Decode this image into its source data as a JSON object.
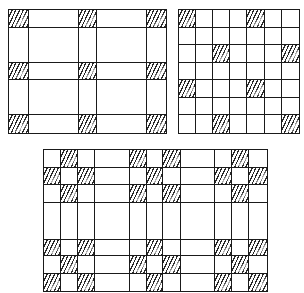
{
  "diagram": {
    "type": "grid-patterns",
    "hatch_color": "#2a2a2a",
    "line_color": "#1a1a1a",
    "grids": [
      {
        "name": "grid-top-left",
        "x": 8,
        "y": 9,
        "width": 159,
        "height": 125,
        "col_widths": [
          20,
          51,
          18,
          51,
          19
        ],
        "row_heights": [
          18,
          36,
          17,
          36,
          18
        ],
        "hatched": [
          [
            0,
            0
          ],
          [
            0,
            2
          ],
          [
            0,
            4
          ],
          [
            2,
            0
          ],
          [
            2,
            2
          ],
          [
            2,
            4
          ],
          [
            4,
            0
          ],
          [
            4,
            2
          ],
          [
            4,
            4
          ]
        ]
      },
      {
        "name": "grid-top-right",
        "x": 178,
        "y": 9,
        "width": 122,
        "height": 125,
        "col_widths": [
          17.4,
          17.4,
          17.4,
          17.4,
          17.4,
          17.4,
          17.6
        ],
        "row_heights": [
          17.8,
          17.8,
          17.8,
          17.8,
          17.8,
          17.8,
          18.2
        ],
        "hatched": [
          [
            0,
            0
          ],
          [
            0,
            4
          ],
          [
            2,
            2
          ],
          [
            2,
            6
          ],
          [
            4,
            0
          ],
          [
            4,
            4
          ],
          [
            6,
            2
          ],
          [
            6,
            6
          ]
        ]
      },
      {
        "name": "grid-bottom",
        "x": 43,
        "y": 149,
        "width": 225,
        "height": 143,
        "col_widths": [
          17,
          17,
          17,
          36,
          17,
          16,
          18,
          35,
          17,
          17,
          18
        ],
        "row_heights": [
          18,
          18,
          18,
          37,
          17,
          18,
          17
        ],
        "hatched": [
          [
            0,
            1
          ],
          [
            0,
            4
          ],
          [
            0,
            6
          ],
          [
            0,
            9
          ],
          [
            1,
            0
          ],
          [
            1,
            2
          ],
          [
            1,
            5
          ],
          [
            1,
            8
          ],
          [
            1,
            10
          ],
          [
            2,
            1
          ],
          [
            2,
            4
          ],
          [
            2,
            6
          ],
          [
            2,
            9
          ],
          [
            4,
            0
          ],
          [
            4,
            2
          ],
          [
            4,
            5
          ],
          [
            4,
            8
          ],
          [
            4,
            10
          ],
          [
            5,
            1
          ],
          [
            5,
            4
          ],
          [
            5,
            6
          ],
          [
            5,
            9
          ],
          [
            6,
            0
          ],
          [
            6,
            2
          ],
          [
            6,
            5
          ],
          [
            6,
            8
          ],
          [
            6,
            10
          ]
        ]
      }
    ]
  }
}
